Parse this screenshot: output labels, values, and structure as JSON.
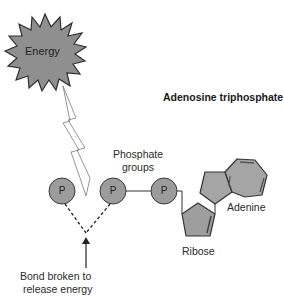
{
  "diagram": {
    "title": "Adenosine triphosphate",
    "energy_label": "Energy",
    "phosphate_groups_label_line1": "Phosphate",
    "phosphate_groups_label_line2": "groups",
    "phosphates": [
      {
        "label": "P"
      },
      {
        "label": "P"
      },
      {
        "label": "P"
      }
    ],
    "adenine_label": "Adenine",
    "ribose_label": "Ribose",
    "bond_label_line1": "Bond broken to",
    "bond_label_line2": "release energy",
    "icons": [
      "energy-starburst-icon",
      "lightning-bolt-icon",
      "arrow-up-icon"
    ],
    "colors": {
      "shape_fill": "#9a9a9a",
      "shape_stroke": "#3a3a3a",
      "ring_fill": "#a8a8a8",
      "bolt_fill": "#ffffff",
      "bolt_stroke": "#777777",
      "text": "#2a2a2a"
    }
  }
}
